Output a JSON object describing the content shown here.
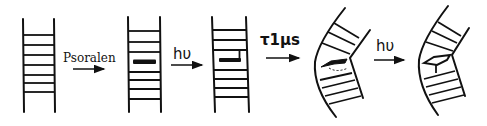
{
  "diagram": {
    "colors": {
      "ink": "#111111",
      "background": "#ffffff"
    },
    "stages": [
      {
        "id": "dna",
        "label": "DNA duplex"
      },
      {
        "id": "intercalated",
        "label": "Psoralen intercalated"
      },
      {
        "id": "monoadduct",
        "label": "Monoadduct"
      },
      {
        "id": "bent",
        "label": "Bent monoadduct"
      },
      {
        "id": "crosslink",
        "label": "Interstrand crosslink"
      }
    ],
    "steps": [
      {
        "label": "Psoralen"
      },
      {
        "label": "hυ"
      },
      {
        "label": "τ1μs"
      },
      {
        "label": "hυ"
      }
    ]
  }
}
